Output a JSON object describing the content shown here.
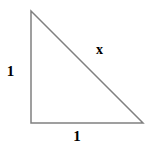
{
  "figure": {
    "kind": "right-triangle-diagram",
    "width": 151,
    "height": 148,
    "background_color": "#ffffff",
    "stroke_color": "#808080",
    "stroke_width": 1.5,
    "label_color": "#000000",
    "vertices": {
      "top_left": {
        "x": 31,
        "y": 11
      },
      "bottom_left": {
        "x": 31,
        "y": 123
      },
      "bottom_right": {
        "x": 143,
        "y": 123
      }
    },
    "polygon_points": "31,11 31,123 143,123",
    "labels": {
      "vertical_leg": "1",
      "horizontal_leg": "1",
      "hypotenuse": "x"
    }
  }
}
